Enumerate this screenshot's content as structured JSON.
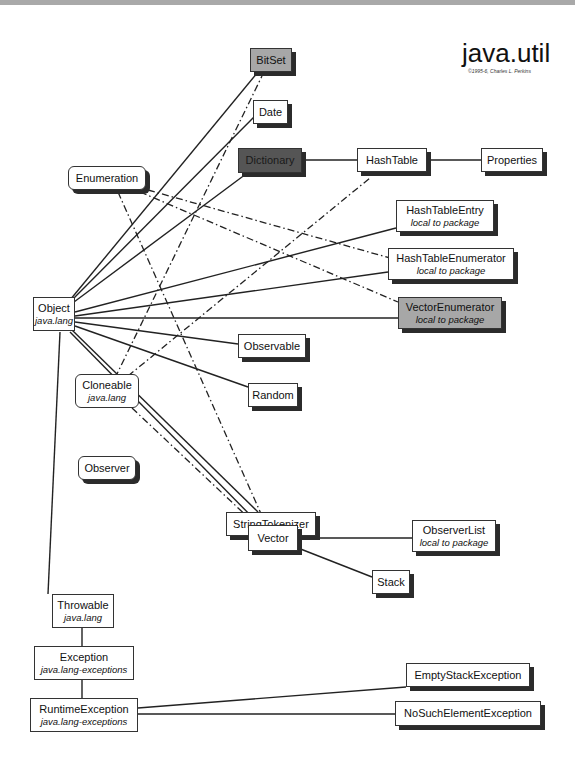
{
  "header": {
    "title": "java.util",
    "credit": "©1995-6, Charles L. Perkins"
  },
  "colors": {
    "abstract_class": "#a7a7a7",
    "dictionary_class": "#555555",
    "normal_class": "#ffffff",
    "line": "#222222",
    "topbar": "#a9a9a9"
  },
  "nodes": {
    "bitset": {
      "label": "BitSet",
      "sub": "",
      "style": "grey-shadow"
    },
    "date": {
      "label": "Date",
      "sub": "",
      "style": "shadow"
    },
    "dictionary": {
      "label": "Dictionary",
      "sub": "",
      "style": "dark-shadow"
    },
    "hashtable": {
      "label": "HashTable",
      "sub": "",
      "style": "shadow"
    },
    "properties": {
      "label": "Properties",
      "sub": "",
      "style": "shadow"
    },
    "enumeration": {
      "label": "Enumeration",
      "sub": "",
      "style": "interface"
    },
    "hashtableentry": {
      "label": "HashTableEntry",
      "sub": "local to package",
      "style": "shadow"
    },
    "hashtableenumerator": {
      "label": "HashTableEnumerator",
      "sub": "local to package",
      "style": "shadow"
    },
    "vectorenumerator": {
      "label": "VectorEnumerator",
      "sub": "local to package",
      "style": "grey-shadow"
    },
    "object": {
      "label": "Object",
      "sub": "java.lang",
      "style": "plain"
    },
    "observable": {
      "label": "Observable",
      "sub": "",
      "style": "shadow"
    },
    "random": {
      "label": "Random",
      "sub": "",
      "style": "shadow"
    },
    "cloneable": {
      "label": "Cloneable",
      "sub": "java.lang",
      "style": "interface-plain"
    },
    "observer": {
      "label": "Observer",
      "sub": "",
      "style": "interface"
    },
    "stringtokenizer": {
      "label": "StringTokenizer",
      "sub": "",
      "style": "shadow"
    },
    "vector": {
      "label": "Vector",
      "sub": "",
      "style": "shadow"
    },
    "observerlist": {
      "label": "ObserverList",
      "sub": "local to package",
      "style": "shadow"
    },
    "stack": {
      "label": "Stack",
      "sub": "",
      "style": "shadow"
    },
    "throwable": {
      "label": "Throwable",
      "sub": "java.lang",
      "style": "plain"
    },
    "exception": {
      "label": "Exception",
      "sub": "java.lang-exceptions",
      "style": "plain"
    },
    "runtimeexception": {
      "label": "RuntimeException",
      "sub": "java.lang-exceptions",
      "style": "plain"
    },
    "emptystackexception": {
      "label": "EmptyStackException",
      "sub": "",
      "style": "shadow"
    },
    "nosuchelementexception": {
      "label": "NoSuchElementException",
      "sub": "",
      "style": "shadow"
    }
  },
  "edges": {
    "inheritance": [
      [
        "object",
        "bitset"
      ],
      [
        "object",
        "date"
      ],
      [
        "object",
        "dictionary"
      ],
      [
        "dictionary",
        "hashtable"
      ],
      [
        "hashtable",
        "properties"
      ],
      [
        "object",
        "hashtableentry"
      ],
      [
        "object",
        "hashtableenumerator"
      ],
      [
        "object",
        "vectorenumerator"
      ],
      [
        "object",
        "observable"
      ],
      [
        "object",
        "random"
      ],
      [
        "object",
        "stringtokenizer"
      ],
      [
        "object",
        "vector"
      ],
      [
        "vector",
        "observerlist"
      ],
      [
        "vector",
        "stack"
      ],
      [
        "object",
        "throwable"
      ],
      [
        "throwable",
        "exception"
      ],
      [
        "exception",
        "runtimeexception"
      ],
      [
        "runtimeexception",
        "emptystackexception"
      ],
      [
        "runtimeexception",
        "nosuchelementexception"
      ]
    ],
    "implements": [
      [
        "enumeration",
        "stringtokenizer"
      ],
      [
        "enumeration",
        "hashtableenumerator"
      ],
      [
        "enumeration",
        "vectorenumerator"
      ],
      [
        "cloneable",
        "bitset"
      ],
      [
        "cloneable",
        "hashtable"
      ],
      [
        "cloneable",
        "vector"
      ]
    ]
  }
}
